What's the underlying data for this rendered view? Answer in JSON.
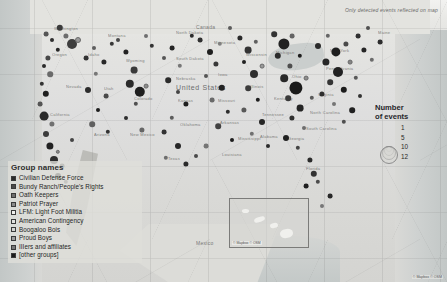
{
  "map": {
    "note": "Only detected events reflected on map",
    "attribution": "© Mapbox © OSM",
    "inset_attribution": "© Mapbox © OSM",
    "country_label": "United States",
    "neighbor_labels": [
      "Canada",
      "Mexico"
    ],
    "place_labels": [
      {
        "name": "Washington",
        "x": 54,
        "y": 26
      },
      {
        "name": "Montana",
        "x": 108,
        "y": 33
      },
      {
        "name": "North\nDakota",
        "x": 176,
        "y": 30
      },
      {
        "name": "Minnesota",
        "x": 214,
        "y": 40
      },
      {
        "name": "Maine",
        "x": 378,
        "y": 30
      },
      {
        "name": "Oregon",
        "x": 52,
        "y": 52
      },
      {
        "name": "Idaho",
        "x": 88,
        "y": 52
      },
      {
        "name": "Wyoming",
        "x": 126,
        "y": 58
      },
      {
        "name": "South\nDakota",
        "x": 176,
        "y": 56
      },
      {
        "name": "Wisconsin",
        "x": 246,
        "y": 52
      },
      {
        "name": "Michigan",
        "x": 276,
        "y": 50
      },
      {
        "name": "New York",
        "x": 330,
        "y": 48
      },
      {
        "name": "Nevada",
        "x": 66,
        "y": 84
      },
      {
        "name": "Utah",
        "x": 104,
        "y": 86
      },
      {
        "name": "Nebraska",
        "x": 176,
        "y": 76
      },
      {
        "name": "Iowa",
        "x": 218,
        "y": 72
      },
      {
        "name": "Illinois",
        "x": 250,
        "y": 84
      },
      {
        "name": "Ohio",
        "x": 292,
        "y": 74
      },
      {
        "name": "Pennsylvania",
        "x": 326,
        "y": 66
      },
      {
        "name": "California",
        "x": 50,
        "y": 112
      },
      {
        "name": "Colorado",
        "x": 134,
        "y": 96
      },
      {
        "name": "Kansas",
        "x": 178,
        "y": 98
      },
      {
        "name": "Missouri",
        "x": 218,
        "y": 98
      },
      {
        "name": "Kentucky",
        "x": 274,
        "y": 96
      },
      {
        "name": "Virginia",
        "x": 318,
        "y": 92
      },
      {
        "name": "Arizona",
        "x": 94,
        "y": 132
      },
      {
        "name": "New Mexico",
        "x": 130,
        "y": 132
      },
      {
        "name": "Oklahoma",
        "x": 180,
        "y": 122
      },
      {
        "name": "Arkansas",
        "x": 220,
        "y": 120
      },
      {
        "name": "Tennessee",
        "x": 262,
        "y": 112
      },
      {
        "name": "North Carolina",
        "x": 310,
        "y": 110
      },
      {
        "name": "South\nCarolina",
        "x": 306,
        "y": 126
      },
      {
        "name": "Georgia",
        "x": 288,
        "y": 136
      },
      {
        "name": "Alabama",
        "x": 260,
        "y": 134
      },
      {
        "name": "Mississippi",
        "x": 238,
        "y": 136
      },
      {
        "name": "Texas",
        "x": 168,
        "y": 156
      },
      {
        "name": "Louisiana",
        "x": 222,
        "y": 152
      },
      {
        "name": "Florida",
        "x": 306,
        "y": 166
      }
    ]
  },
  "group_legend": {
    "title": "Group names",
    "items": [
      {
        "label": "Civilian Defense Force",
        "color": "#2b2b2b"
      },
      {
        "label": "Bundy Ranch/People's Rights",
        "color": "#4a4a4a"
      },
      {
        "label": "Oath Keepers",
        "color": "#6e6e6e"
      },
      {
        "label": "Patriot Prayer",
        "color": "#8a8a8a"
      },
      {
        "label": "LFM: Light Foot Militia",
        "color": "#efefec"
      },
      {
        "label": "American Contingency",
        "color": "#e2e2df"
      },
      {
        "label": "Boogaloo Bois",
        "color": "#d5d5d2"
      },
      {
        "label": "Proud Boys",
        "color": "#9c9c9c"
      },
      {
        "label": "IIIers and affiliates",
        "color": "#777777"
      },
      {
        "label": "[other groups]",
        "color": "#1c1c1c"
      }
    ]
  },
  "size_legend": {
    "title_line1": "Number",
    "title_line2": "of events",
    "values": [
      "1",
      "5",
      "10",
      "12"
    ]
  },
  "chart_data": {
    "type": "scatter",
    "note": "Only detected events reflected on map",
    "encoding": {
      "x": "longitude",
      "y": "latitude",
      "size": "number of events",
      "color": "group name"
    },
    "size_scale": {
      "values": [
        1,
        5,
        10,
        12
      ],
      "radius_px": [
        2,
        4,
        6,
        8
      ]
    },
    "legend_position": "right",
    "points": [
      {
        "x": 60,
        "y": 28,
        "r": 3.2,
        "c": "#3a3a3a"
      },
      {
        "x": 46,
        "y": 34,
        "r": 2.4,
        "c": "#555"
      },
      {
        "x": 52,
        "y": 40,
        "r": 2.0,
        "c": "#2e2e2e"
      },
      {
        "x": 66,
        "y": 36,
        "r": 2.6,
        "c": "#6c6c6c"
      },
      {
        "x": 72,
        "y": 44,
        "r": 5.0,
        "c": "#3d3d3d"
      },
      {
        "x": 78,
        "y": 40,
        "r": 3.0,
        "c": "#9b9b9b"
      },
      {
        "x": 58,
        "y": 50,
        "r": 2.2,
        "c": "#262626"
      },
      {
        "x": 48,
        "y": 58,
        "r": 2.6,
        "c": "#484848"
      },
      {
        "x": 44,
        "y": 66,
        "r": 2.0,
        "c": "#2b2b2b"
      },
      {
        "x": 50,
        "y": 74,
        "r": 2.8,
        "c": "#6a6a6a"
      },
      {
        "x": 42,
        "y": 84,
        "r": 2.2,
        "c": "#333"
      },
      {
        "x": 46,
        "y": 94,
        "r": 3.2,
        "c": "#1f1f1f"
      },
      {
        "x": 40,
        "y": 104,
        "r": 2.4,
        "c": "#555"
      },
      {
        "x": 44,
        "y": 116,
        "r": 4.4,
        "c": "#2a2a2a"
      },
      {
        "x": 52,
        "y": 124,
        "r": 2.6,
        "c": "#707070"
      },
      {
        "x": 46,
        "y": 134,
        "r": 3.0,
        "c": "#3c3c3c"
      },
      {
        "x": 50,
        "y": 146,
        "r": 3.6,
        "c": "#222"
      },
      {
        "x": 58,
        "y": 152,
        "r": 2.2,
        "c": "#8a8a8a"
      },
      {
        "x": 54,
        "y": 160,
        "r": 4.0,
        "c": "#2e2e2e"
      },
      {
        "x": 62,
        "y": 166,
        "r": 2.4,
        "c": "#4d4d4d"
      },
      {
        "x": 58,
        "y": 176,
        "r": 3.0,
        "c": "#1e1e1e"
      },
      {
        "x": 66,
        "y": 182,
        "r": 2.2,
        "c": "#666"
      },
      {
        "x": 72,
        "y": 140,
        "r": 2.0,
        "c": "#444"
      },
      {
        "x": 86,
        "y": 58,
        "r": 2.4,
        "c": "#333"
      },
      {
        "x": 94,
        "y": 48,
        "r": 2.0,
        "c": "#5e5e5e"
      },
      {
        "x": 104,
        "y": 62,
        "r": 2.6,
        "c": "#282828"
      },
      {
        "x": 96,
        "y": 74,
        "r": 2.2,
        "c": "#777"
      },
      {
        "x": 88,
        "y": 90,
        "r": 3.0,
        "c": "#2c2c2c"
      },
      {
        "x": 106,
        "y": 96,
        "r": 2.4,
        "c": "#4a4a4a"
      },
      {
        "x": 98,
        "y": 110,
        "r": 2.0,
        "c": "#1d1d1d"
      },
      {
        "x": 92,
        "y": 124,
        "r": 2.8,
        "c": "#606060"
      },
      {
        "x": 108,
        "y": 132,
        "r": 2.2,
        "c": "#333"
      },
      {
        "x": 118,
        "y": 40,
        "r": 2.0,
        "c": "#494949"
      },
      {
        "x": 126,
        "y": 52,
        "r": 2.6,
        "c": "#222"
      },
      {
        "x": 134,
        "y": 70,
        "r": 3.4,
        "c": "#3a3a3a"
      },
      {
        "x": 130,
        "y": 84,
        "r": 4.2,
        "c": "#2a2a2a"
      },
      {
        "x": 140,
        "y": 92,
        "r": 5.2,
        "c": "#1f1f1f"
      },
      {
        "x": 146,
        "y": 86,
        "r": 2.4,
        "c": "#8c8c8c"
      },
      {
        "x": 136,
        "y": 104,
        "r": 2.2,
        "c": "#505050"
      },
      {
        "x": 126,
        "y": 118,
        "r": 2.0,
        "c": "#2e2e2e"
      },
      {
        "x": 142,
        "y": 130,
        "r": 2.6,
        "c": "#666"
      },
      {
        "x": 152,
        "y": 46,
        "r": 2.2,
        "c": "#333"
      },
      {
        "x": 164,
        "y": 58,
        "r": 2.0,
        "c": "#555"
      },
      {
        "x": 172,
        "y": 48,
        "r": 2.4,
        "c": "#242424"
      },
      {
        "x": 180,
        "y": 66,
        "r": 2.2,
        "c": "#777"
      },
      {
        "x": 168,
        "y": 80,
        "r": 2.8,
        "c": "#2b2b2b"
      },
      {
        "x": 178,
        "y": 92,
        "r": 2.0,
        "c": "#444"
      },
      {
        "x": 186,
        "y": 104,
        "r": 2.6,
        "c": "#1e1e1e"
      },
      {
        "x": 172,
        "y": 118,
        "r": 2.2,
        "c": "#5c5c5c"
      },
      {
        "x": 164,
        "y": 132,
        "r": 2.4,
        "c": "#333"
      },
      {
        "x": 178,
        "y": 146,
        "r": 3.0,
        "c": "#272727"
      },
      {
        "x": 166,
        "y": 158,
        "r": 2.2,
        "c": "#6e6e6e"
      },
      {
        "x": 186,
        "y": 164,
        "r": 2.6,
        "c": "#2a2a2a"
      },
      {
        "x": 196,
        "y": 156,
        "r": 2.0,
        "c": "#4a4a4a"
      },
      {
        "x": 200,
        "y": 40,
        "r": 2.4,
        "c": "#303030"
      },
      {
        "x": 210,
        "y": 52,
        "r": 3.0,
        "c": "#1f1f1f"
      },
      {
        "x": 220,
        "y": 44,
        "r": 2.2,
        "c": "#808080"
      },
      {
        "x": 216,
        "y": 64,
        "r": 2.6,
        "c": "#383838"
      },
      {
        "x": 206,
        "y": 76,
        "r": 2.0,
        "c": "#555"
      },
      {
        "x": 222,
        "y": 88,
        "r": 3.2,
        "c": "#232323"
      },
      {
        "x": 212,
        "y": 100,
        "r": 2.4,
        "c": "#6a6a6a"
      },
      {
        "x": 228,
        "y": 112,
        "r": 2.2,
        "c": "#2d2d2d"
      },
      {
        "x": 218,
        "y": 126,
        "r": 2.8,
        "c": "#414141"
      },
      {
        "x": 232,
        "y": 140,
        "r": 2.0,
        "c": "#1c1c1c"
      },
      {
        "x": 206,
        "y": 146,
        "r": 2.4,
        "c": "#757575"
      },
      {
        "x": 240,
        "y": 38,
        "r": 2.6,
        "c": "#2a2a2a"
      },
      {
        "x": 248,
        "y": 50,
        "r": 3.4,
        "c": "#333"
      },
      {
        "x": 256,
        "y": 42,
        "r": 2.2,
        "c": "#5f5f5f"
      },
      {
        "x": 244,
        "y": 62,
        "r": 2.0,
        "c": "#212121"
      },
      {
        "x": 254,
        "y": 74,
        "r": 4.0,
        "c": "#2e2e2e"
      },
      {
        "x": 262,
        "y": 66,
        "r": 2.4,
        "c": "#9a9a9a"
      },
      {
        "x": 248,
        "y": 88,
        "r": 2.8,
        "c": "#3c3c3c"
      },
      {
        "x": 258,
        "y": 100,
        "r": 2.2,
        "c": "#1e1e1e"
      },
      {
        "x": 244,
        "y": 110,
        "r": 2.6,
        "c": "#585858"
      },
      {
        "x": 262,
        "y": 122,
        "r": 3.0,
        "c": "#262626"
      },
      {
        "x": 252,
        "y": 134,
        "r": 2.2,
        "c": "#707070"
      },
      {
        "x": 268,
        "y": 146,
        "r": 2.0,
        "c": "#2b2b2b"
      },
      {
        "x": 274,
        "y": 34,
        "r": 2.8,
        "c": "#333"
      },
      {
        "x": 284,
        "y": 44,
        "r": 5.6,
        "c": "#222"
      },
      {
        "x": 292,
        "y": 36,
        "r": 2.4,
        "c": "#646464"
      },
      {
        "x": 278,
        "y": 56,
        "r": 3.2,
        "c": "#2c2c2c"
      },
      {
        "x": 290,
        "y": 66,
        "r": 2.6,
        "c": "#4e4e4e"
      },
      {
        "x": 300,
        "y": 56,
        "r": 2.2,
        "c": "#1d1d1d"
      },
      {
        "x": 284,
        "y": 78,
        "r": 3.8,
        "c": "#292929"
      },
      {
        "x": 296,
        "y": 88,
        "r": 6.6,
        "c": "#1a1a1a"
      },
      {
        "x": 306,
        "y": 78,
        "r": 2.4,
        "c": "#8e8e8e"
      },
      {
        "x": 288,
        "y": 98,
        "r": 2.8,
        "c": "#3a3a3a"
      },
      {
        "x": 300,
        "y": 108,
        "r": 3.4,
        "c": "#242424"
      },
      {
        "x": 312,
        "y": 98,
        "r": 2.2,
        "c": "#5a5a5a"
      },
      {
        "x": 292,
        "y": 118,
        "r": 2.6,
        "c": "#2f2f2f"
      },
      {
        "x": 304,
        "y": 128,
        "r": 2.0,
        "c": "#6d6d6d"
      },
      {
        "x": 286,
        "y": 138,
        "r": 3.0,
        "c": "#202020"
      },
      {
        "x": 298,
        "y": 148,
        "r": 2.2,
        "c": "#444"
      },
      {
        "x": 310,
        "y": 160,
        "r": 2.6,
        "c": "#2a2a2a"
      },
      {
        "x": 314,
        "y": 174,
        "r": 3.2,
        "c": "#333"
      },
      {
        "x": 306,
        "y": 186,
        "r": 2.4,
        "c": "#1f1f1f"
      },
      {
        "x": 318,
        "y": 46,
        "r": 3.0,
        "c": "#2b2b2b"
      },
      {
        "x": 328,
        "y": 36,
        "r": 2.2,
        "c": "#666"
      },
      {
        "x": 336,
        "y": 52,
        "r": 4.6,
        "c": "#1e1e1e"
      },
      {
        "x": 346,
        "y": 44,
        "r": 2.6,
        "c": "#4a4a4a"
      },
      {
        "x": 326,
        "y": 62,
        "r": 3.6,
        "c": "#272727"
      },
      {
        "x": 338,
        "y": 72,
        "r": 5.0,
        "c": "#222"
      },
      {
        "x": 350,
        "y": 62,
        "r": 2.4,
        "c": "#858585"
      },
      {
        "x": 330,
        "y": 82,
        "r": 2.8,
        "c": "#353535"
      },
      {
        "x": 344,
        "y": 90,
        "r": 3.2,
        "c": "#1c1c1c"
      },
      {
        "x": 356,
        "y": 78,
        "r": 2.2,
        "c": "#595959"
      },
      {
        "x": 322,
        "y": 94,
        "r": 2.6,
        "c": "#2e2e2e"
      },
      {
        "x": 334,
        "y": 104,
        "r": 2.0,
        "c": "#757575"
      },
      {
        "x": 358,
        "y": 36,
        "r": 2.4,
        "c": "#303030"
      },
      {
        "x": 368,
        "y": 28,
        "r": 2.0,
        "c": "#505050"
      },
      {
        "x": 364,
        "y": 50,
        "r": 2.6,
        "c": "#252525"
      },
      {
        "x": 372,
        "y": 60,
        "r": 2.2,
        "c": "#6b6b6b"
      },
      {
        "x": 380,
        "y": 42,
        "r": 2.4,
        "c": "#2d2d2d"
      },
      {
        "x": 352,
        "y": 110,
        "r": 2.8,
        "c": "#212121"
      },
      {
        "x": 344,
        "y": 122,
        "r": 2.2,
        "c": "#4f4f4f"
      },
      {
        "x": 360,
        "y": 96,
        "r": 2.0,
        "c": "#333"
      },
      {
        "x": 230,
        "y": 28,
        "r": 2.0,
        "c": "#5b5b5b"
      },
      {
        "x": 192,
        "y": 36,
        "r": 2.2,
        "c": "#2c2c2c"
      },
      {
        "x": 146,
        "y": 36,
        "r": 2.0,
        "c": "#6f6f6f"
      },
      {
        "x": 112,
        "y": 44,
        "r": 2.2,
        "c": "#373737"
      },
      {
        "x": 318,
        "y": 182,
        "r": 2.2,
        "c": "#4c4c4c"
      },
      {
        "x": 330,
        "y": 196,
        "r": 2.4,
        "c": "#282828"
      },
      {
        "x": 322,
        "y": 206,
        "r": 2.0,
        "c": "#777"
      }
    ]
  }
}
